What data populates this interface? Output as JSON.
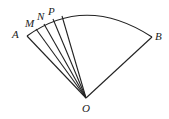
{
  "diagram": {
    "type": "sector",
    "points": {
      "O": {
        "label": "O",
        "x": 86,
        "y": 98
      },
      "A": {
        "label": "A",
        "x": 27,
        "y": 36
      },
      "B": {
        "label": "B",
        "x": 152,
        "y": 37
      },
      "M": {
        "label": "M",
        "x": 36,
        "y": 29
      },
      "N": {
        "label": "N",
        "x": 44,
        "y": 24
      },
      "P": {
        "label": "P",
        "x": 53,
        "y": 19
      }
    },
    "labels": {
      "A": "A",
      "M": "M",
      "N": "N",
      "P": "P",
      "B": "B",
      "O": "O"
    }
  }
}
